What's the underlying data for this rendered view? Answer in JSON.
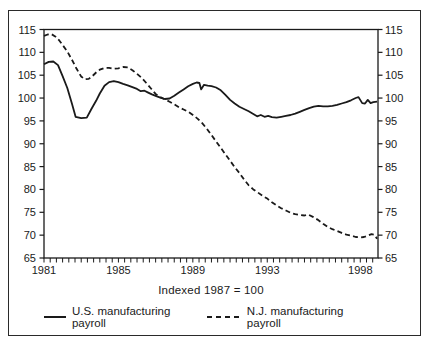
{
  "chart_data": {
    "type": "line",
    "caption": "Indexed 1987 = 100",
    "x_axis": {
      "range": [
        1981,
        1998.95
      ],
      "tick_labels": [
        1981,
        1985,
        1989,
        1993,
        1998
      ],
      "minor_tick_interval_years": 0.3333,
      "grid": false
    },
    "y_axis": {
      "range": [
        65,
        115
      ],
      "tick_labels": [
        65,
        70,
        75,
        80,
        85,
        90,
        95,
        100,
        105,
        110,
        115
      ],
      "mirrored_right_axis": true,
      "grid": false
    },
    "colors": {
      "line": "#1a1a1a",
      "frame": "#2a2a2a",
      "background": "#ffffff"
    },
    "legend_position": "bottom",
    "series": [
      {
        "name": "U.S. manufacturing payroll",
        "style": "solid",
        "points": [
          [
            1981.0,
            107.4
          ],
          [
            1981.25,
            107.9
          ],
          [
            1981.5,
            108.0
          ],
          [
            1981.75,
            107.2
          ],
          [
            1982.0,
            104.8
          ],
          [
            1982.25,
            102.2
          ],
          [
            1982.5,
            98.8
          ],
          [
            1982.7,
            95.9
          ],
          [
            1983.0,
            95.6
          ],
          [
            1983.3,
            95.7
          ],
          [
            1983.55,
            97.6
          ],
          [
            1983.8,
            99.4
          ],
          [
            1984.0,
            101.0
          ],
          [
            1984.25,
            102.7
          ],
          [
            1984.5,
            103.5
          ],
          [
            1984.75,
            103.7
          ],
          [
            1985.0,
            103.5
          ],
          [
            1985.25,
            103.1
          ],
          [
            1985.5,
            102.8
          ],
          [
            1985.75,
            102.4
          ],
          [
            1986.0,
            102.0
          ],
          [
            1986.2,
            101.5
          ],
          [
            1986.4,
            101.6
          ],
          [
            1986.6,
            101.2
          ],
          [
            1986.8,
            100.8
          ],
          [
            1987.0,
            100.5
          ],
          [
            1987.25,
            100.1
          ],
          [
            1987.5,
            99.8
          ],
          [
            1987.75,
            99.9
          ],
          [
            1988.0,
            100.5
          ],
          [
            1988.25,
            101.2
          ],
          [
            1988.5,
            101.9
          ],
          [
            1988.75,
            102.6
          ],
          [
            1989.0,
            103.1
          ],
          [
            1989.2,
            103.4
          ],
          [
            1989.35,
            103.3
          ],
          [
            1989.45,
            101.9
          ],
          [
            1989.6,
            102.9
          ],
          [
            1989.8,
            102.7
          ],
          [
            1990.0,
            102.6
          ],
          [
            1990.25,
            102.3
          ],
          [
            1990.5,
            101.7
          ],
          [
            1990.75,
            100.7
          ],
          [
            1991.0,
            99.6
          ],
          [
            1991.25,
            98.8
          ],
          [
            1991.5,
            98.1
          ],
          [
            1991.75,
            97.6
          ],
          [
            1992.0,
            97.1
          ],
          [
            1992.25,
            96.5
          ],
          [
            1992.45,
            96.0
          ],
          [
            1992.65,
            96.3
          ],
          [
            1992.85,
            95.9
          ],
          [
            1993.05,
            96.1
          ],
          [
            1993.25,
            95.8
          ],
          [
            1993.5,
            95.7
          ],
          [
            1993.75,
            95.9
          ],
          [
            1994.0,
            96.1
          ],
          [
            1994.25,
            96.3
          ],
          [
            1994.5,
            96.6
          ],
          [
            1994.75,
            97.0
          ],
          [
            1995.0,
            97.4
          ],
          [
            1995.25,
            97.8
          ],
          [
            1995.5,
            98.1
          ],
          [
            1995.75,
            98.3
          ],
          [
            1996.0,
            98.2
          ],
          [
            1996.25,
            98.2
          ],
          [
            1996.5,
            98.3
          ],
          [
            1996.75,
            98.5
          ],
          [
            1997.0,
            98.8
          ],
          [
            1997.25,
            99.1
          ],
          [
            1997.5,
            99.5
          ],
          [
            1997.75,
            100.0
          ],
          [
            1997.9,
            100.2
          ],
          [
            1998.1,
            98.9
          ],
          [
            1998.25,
            98.8
          ],
          [
            1998.4,
            99.6
          ],
          [
            1998.55,
            98.9
          ],
          [
            1998.7,
            99.1
          ],
          [
            1998.9,
            99.2
          ]
        ]
      },
      {
        "name": "N.J. manufacturing payroll",
        "style": "dashed",
        "points": [
          [
            1981.0,
            113.6
          ],
          [
            1981.2,
            113.9
          ],
          [
            1981.4,
            114.0
          ],
          [
            1981.6,
            113.5
          ],
          [
            1981.8,
            112.7
          ],
          [
            1982.0,
            111.6
          ],
          [
            1982.25,
            110.2
          ],
          [
            1982.5,
            108.4
          ],
          [
            1982.75,
            106.4
          ],
          [
            1983.0,
            104.7
          ],
          [
            1983.2,
            104.1
          ],
          [
            1983.4,
            104.2
          ],
          [
            1983.6,
            104.8
          ],
          [
            1983.8,
            105.6
          ],
          [
            1984.0,
            106.2
          ],
          [
            1984.25,
            106.6
          ],
          [
            1984.5,
            106.6
          ],
          [
            1984.75,
            106.4
          ],
          [
            1985.0,
            106.5
          ],
          [
            1985.25,
            106.8
          ],
          [
            1985.5,
            106.7
          ],
          [
            1985.75,
            106.1
          ],
          [
            1986.0,
            105.3
          ],
          [
            1986.25,
            104.4
          ],
          [
            1986.5,
            103.3
          ],
          [
            1986.75,
            102.1
          ],
          [
            1987.0,
            100.9
          ],
          [
            1987.25,
            100.2
          ],
          [
            1987.5,
            99.7
          ],
          [
            1987.75,
            99.2
          ],
          [
            1988.0,
            98.6
          ],
          [
            1988.25,
            98.0
          ],
          [
            1988.5,
            97.5
          ],
          [
            1988.75,
            97.0
          ],
          [
            1989.0,
            96.3
          ],
          [
            1989.25,
            95.5
          ],
          [
            1989.5,
            94.5
          ],
          [
            1989.75,
            93.3
          ],
          [
            1990.0,
            91.9
          ],
          [
            1990.25,
            90.5
          ],
          [
            1990.5,
            89.1
          ],
          [
            1990.75,
            87.7
          ],
          [
            1991.0,
            86.3
          ],
          [
            1991.25,
            84.9
          ],
          [
            1991.5,
            83.6
          ],
          [
            1991.75,
            82.2
          ],
          [
            1992.0,
            80.9
          ],
          [
            1992.25,
            80.0
          ],
          [
            1992.5,
            79.3
          ],
          [
            1992.75,
            78.6
          ],
          [
            1993.0,
            78.0
          ],
          [
            1993.25,
            77.2
          ],
          [
            1993.5,
            76.5
          ],
          [
            1993.75,
            75.9
          ],
          [
            1994.0,
            75.4
          ],
          [
            1994.25,
            74.9
          ],
          [
            1994.5,
            74.6
          ],
          [
            1994.75,
            74.4
          ],
          [
            1995.0,
            74.3
          ],
          [
            1995.2,
            74.5
          ],
          [
            1995.45,
            74.0
          ],
          [
            1995.7,
            73.4
          ],
          [
            1996.0,
            72.5
          ],
          [
            1996.25,
            71.8
          ],
          [
            1996.5,
            71.3
          ],
          [
            1996.75,
            70.9
          ],
          [
            1997.0,
            70.5
          ],
          [
            1997.25,
            70.1
          ],
          [
            1997.5,
            69.9
          ],
          [
            1997.75,
            69.6
          ],
          [
            1998.0,
            69.5
          ],
          [
            1998.2,
            69.6
          ],
          [
            1998.4,
            69.9
          ],
          [
            1998.6,
            70.2
          ],
          [
            1998.75,
            70.1
          ],
          [
            1998.9,
            69.2
          ]
        ]
      }
    ]
  },
  "legend": {
    "items": [
      {
        "label": "U.S. manufacturing payroll",
        "style": "solid"
      },
      {
        "label": "N.J. manufacturing payroll",
        "style": "dashed"
      }
    ]
  }
}
